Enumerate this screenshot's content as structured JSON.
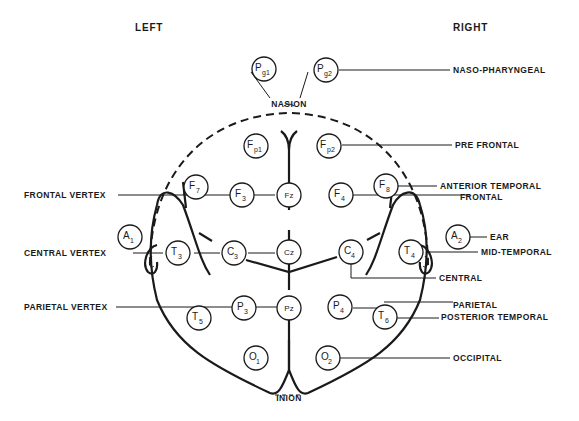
{
  "sides": {
    "left": "LEFT",
    "right": "RIGHT"
  },
  "landmarks": {
    "nasion": "NASION",
    "inion": "INION"
  },
  "electrodes": {
    "pg1": {
      "main": "P",
      "sub": "g1"
    },
    "pg2": {
      "main": "P",
      "sub": "g2"
    },
    "fp1": {
      "main": "F",
      "sub": "p1"
    },
    "fp2": {
      "main": "F",
      "sub": "p2"
    },
    "f7": {
      "main": "F",
      "sub": "7"
    },
    "f3": {
      "main": "F",
      "sub": "3"
    },
    "fz": {
      "main": "Fz",
      "sub": ""
    },
    "f4": {
      "main": "F",
      "sub": "4"
    },
    "f8": {
      "main": "F",
      "sub": "8"
    },
    "a1": {
      "main": "A",
      "sub": "1"
    },
    "t3": {
      "main": "T",
      "sub": "3"
    },
    "c3": {
      "main": "C",
      "sub": "3"
    },
    "cz": {
      "main": "Cz",
      "sub": ""
    },
    "c4": {
      "main": "C",
      "sub": "4"
    },
    "t4": {
      "main": "T",
      "sub": "4"
    },
    "a2": {
      "main": "A",
      "sub": "2"
    },
    "t5": {
      "main": "T",
      "sub": "5"
    },
    "p3": {
      "main": "P",
      "sub": "3"
    },
    "pz": {
      "main": "Pz",
      "sub": ""
    },
    "p4": {
      "main": "P",
      "sub": "4"
    },
    "t6": {
      "main": "T",
      "sub": "6"
    },
    "o1": {
      "main": "O",
      "sub": "1"
    },
    "o2": {
      "main": "O",
      "sub": "2"
    }
  },
  "labels": {
    "left": {
      "frontal_vertex": "FRONTAL VERTEX",
      "central_vertex": "CENTRAL VERTEX",
      "parietal_vertex": "PARIETAL VERTEX"
    },
    "right": {
      "naso_pharyngeal": "NASO-PHARYNGEAL",
      "pre_frontal": "PRE FRONTAL",
      "anterior_temporal": "ANTERIOR TEMPORAL",
      "frontal": "FRONTAL",
      "ear": "EAR",
      "mid_temporal": "MID-TEMPORAL",
      "central": "CENTRAL",
      "parietal": "PARIETAL",
      "posterior_temporal": "POSTERIOR TEMPORAL",
      "occipital": "OCCIPITAL"
    }
  }
}
